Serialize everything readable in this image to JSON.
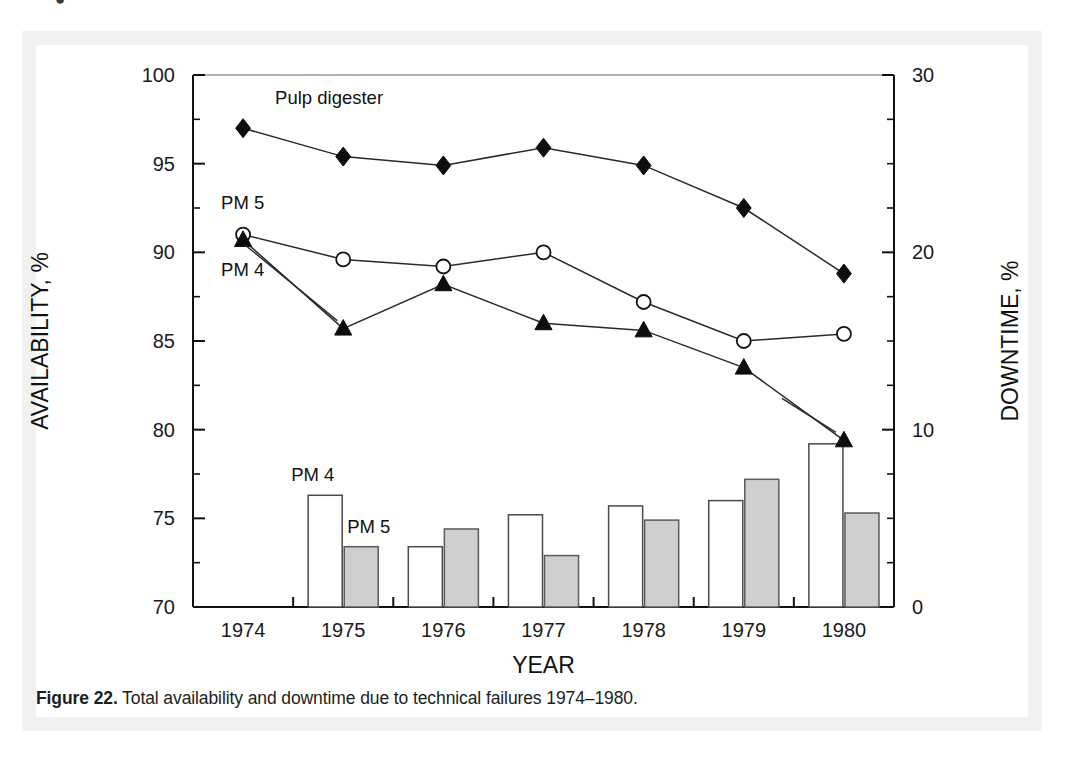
{
  "figure": {
    "number_label": "Figure 22.",
    "caption_text": " Total availability and downtime due to technical failures 1974–1980."
  },
  "stray_mark": "●",
  "chart_data": {
    "type": "bar",
    "title": "",
    "subtitle": "",
    "categories": [
      "1974",
      "1975",
      "1976",
      "1977",
      "1978",
      "1979",
      "1980"
    ],
    "xlabel": "YEAR",
    "ylabel": "AVAILABILITY, %",
    "y2label": "DOWNTIME, %",
    "ylim": [
      70,
      100
    ],
    "y2lim": [
      0,
      30
    ],
    "yticks": [
      70,
      75,
      80,
      85,
      90,
      95,
      100
    ],
    "yticklabels": [
      "70",
      "75",
      "80",
      "85",
      "90",
      "95",
      "100"
    ],
    "y2ticks": [
      0,
      10,
      20,
      30
    ],
    "y2ticklabels": [
      "0",
      "10",
      "20",
      "30"
    ],
    "ytick_minor_step": 2.5,
    "y2tick_minor_step": 2.5,
    "grid": false,
    "legend_position": "inline-annotations",
    "series": [
      {
        "name": "Pulp digester",
        "chart_type": "line",
        "axis": "left",
        "marker": "filled-diamond",
        "label_text": "Pulp digester",
        "values": [
          97.0,
          95.4,
          94.9,
          95.9,
          94.9,
          92.5,
          88.8
        ]
      },
      {
        "name": "PM 5",
        "chart_type": "line",
        "axis": "left",
        "marker": "open-circle",
        "label_text": "PM 5",
        "values": [
          91.0,
          89.6,
          89.2,
          90.0,
          87.2,
          85.0,
          85.4
        ]
      },
      {
        "name": "PM 4",
        "chart_type": "line",
        "axis": "left",
        "marker": "filled-triangle",
        "label_text": "PM 4",
        "values": [
          90.7,
          85.7,
          88.2,
          86.0,
          85.6,
          83.5,
          79.4
        ]
      },
      {
        "name": "PM 4 downtime",
        "chart_type": "bar",
        "axis": "right",
        "fill": "#ffffff",
        "label_text": "PM 4",
        "values": [
          null,
          6.3,
          3.4,
          5.2,
          5.7,
          6.0,
          9.2
        ]
      },
      {
        "name": "PM 5 downtime",
        "chart_type": "bar",
        "axis": "right",
        "fill": "#cfcfcf",
        "label_text": "PM 5",
        "values": [
          null,
          3.4,
          4.4,
          2.9,
          4.9,
          7.2,
          5.3
        ]
      }
    ],
    "annotations": [
      {
        "text": "Pulp digester",
        "near": "pulp-digester-1974"
      },
      {
        "text": "PM 5",
        "near": "pm5-line-1974"
      },
      {
        "text": "PM 4",
        "near": "pm4-line-1975"
      },
      {
        "text": "PM 4",
        "near": "pm4-bar-1975"
      },
      {
        "text": "PM 5",
        "near": "pm5-bar-1975"
      }
    ]
  },
  "colors": {
    "ink": "#111111",
    "bar_pm4_fill": "#ffffff",
    "bar_pm5_fill": "#cfcfcf",
    "frame": "#f1f1f1",
    "background": "#ffffff"
  }
}
